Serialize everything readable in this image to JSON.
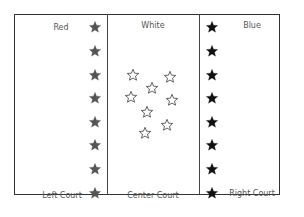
{
  "courts": {
    "left": {
      "team_label": "Red",
      "court_label": "Left Court",
      "star_color": "#555555",
      "star_style": "filled",
      "star_count": 8
    },
    "center": {
      "team_label": "White",
      "court_label": "Center Court",
      "star_color": "#333333",
      "star_style": "outline",
      "star_count": 8
    },
    "right": {
      "team_label": "Blue",
      "court_label": "Right Court",
      "star_color": "#111111",
      "star_style": "filled",
      "star_count": 8
    }
  },
  "icons": {
    "star": "star-icon",
    "star_outline": "star-outline-icon"
  }
}
